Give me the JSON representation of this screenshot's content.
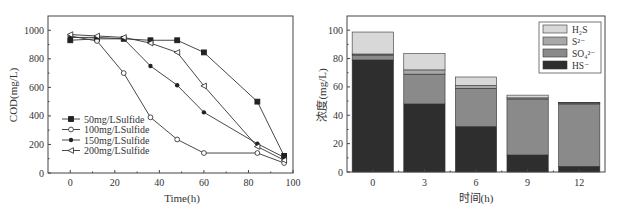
{
  "chart_data": [
    {
      "type": "line",
      "title": "",
      "xlabel": "Time(h)",
      "ylabel": "COD(mg/L)",
      "xlim": [
        -10,
        100
      ],
      "ylim": [
        0,
        1100
      ],
      "xticks": [
        0,
        20,
        40,
        60,
        80,
        100
      ],
      "yticks": [
        0,
        200,
        400,
        600,
        800,
        1000
      ],
      "grid": false,
      "legend_position": "lower-left",
      "x": [
        0,
        12,
        24,
        36,
        48,
        60,
        84,
        96
      ],
      "series": [
        {
          "name": "50mg/LSulfide",
          "marker": "filled-square",
          "values": [
            930,
            940,
            940,
            930,
            930,
            845,
            500,
            120
          ]
        },
        {
          "name": "100mg/LSulfide",
          "marker": "open-circle",
          "values": [
            960,
            925,
            700,
            390,
            235,
            140,
            140,
            70
          ]
        },
        {
          "name": "150mg/LSulfide",
          "marker": "filled-circle",
          "values": [
            950,
            950,
            940,
            750,
            615,
            425,
            205,
            110
          ]
        },
        {
          "name": "200mg/LSulfide",
          "marker": "open-triangle-left",
          "values": [
            970,
            960,
            950,
            910,
            845,
            610,
            185,
            90
          ]
        }
      ]
    },
    {
      "type": "bar",
      "stacked": true,
      "title": "",
      "xlabel": "时间(h)",
      "ylabel": "浓度(mg/L)",
      "ylim": [
        0,
        110
      ],
      "yticks": [
        0,
        20,
        40,
        60,
        80,
        100
      ],
      "grid": false,
      "legend_position": "upper-right",
      "categories": [
        "0",
        "3",
        "6",
        "9",
        "12"
      ],
      "series": [
        {
          "name": "HS⁻",
          "color": "#2e2e2e",
          "values": [
            79,
            48,
            32,
            12,
            4
          ]
        },
        {
          "name": "SO₄²⁻",
          "color": "#8a8a8a",
          "values": [
            3.5,
            21,
            27,
            39.5,
            44
          ]
        },
        {
          "name": "S²⁻",
          "color": "#a8a8a8",
          "values": [
            0.7,
            3,
            2,
            0.8,
            0.7
          ]
        },
        {
          "name": "H₂S",
          "color": "#d8d8d8",
          "values": [
            15.5,
            11.5,
            6,
            1.9,
            0.3
          ]
        }
      ]
    }
  ],
  "left": {
    "xlabel": "Time(h)",
    "ylabel": "COD(mg/L)",
    "xtick_labels": [
      "0",
      "20",
      "40",
      "60",
      "80",
      "100"
    ],
    "ytick_labels": [
      "0",
      "200",
      "400",
      "600",
      "800",
      "1000"
    ],
    "legend": [
      "50mg/LSulfide",
      "100mg/LSulfide",
      "150mg/LSulfide",
      "200mg/LSulfide"
    ]
  },
  "right": {
    "xlabel": "时间(h)",
    "ylabel": "浓度(mg/L)",
    "xtick_labels": [
      "0",
      "3",
      "6",
      "9",
      "12"
    ],
    "ytick_labels": [
      "0",
      "20",
      "40",
      "60",
      "80",
      "100"
    ],
    "legend": [
      "H₂S",
      "S²⁻",
      "SO₄²⁻",
      "HS⁻"
    ]
  }
}
